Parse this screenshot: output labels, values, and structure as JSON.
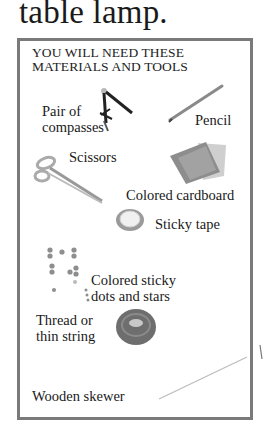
{
  "heading": "table lamp.",
  "materials_box": {
    "title_line1": "YOU WILL NEED THESE",
    "title_line2": "MATERIALS AND TOOLS",
    "items": [
      {
        "label_line1": "Pair of",
        "label_line2": "compasses",
        "icon": "compasses-icon"
      },
      {
        "label_line1": "Pencil",
        "icon": "pencil-icon"
      },
      {
        "label_line1": "Scissors",
        "icon": "scissors-icon"
      },
      {
        "label_line1": "Colored cardboard",
        "icon": "cardboard-icon"
      },
      {
        "label_line1": "Sticky tape",
        "icon": "tape-roll-icon"
      },
      {
        "label_line1": "Colored sticky",
        "label_line2": "dots and stars",
        "icon": "sticky-dots-icon"
      },
      {
        "label_line1": "Thread or",
        "label_line2": "thin string",
        "icon": "thread-spool-icon"
      },
      {
        "label_line1": "Wooden skewer",
        "icon": "skewer-icon"
      }
    ]
  },
  "colors": {
    "border": "#7a7a7a",
    "text": "#1a1a1a"
  }
}
